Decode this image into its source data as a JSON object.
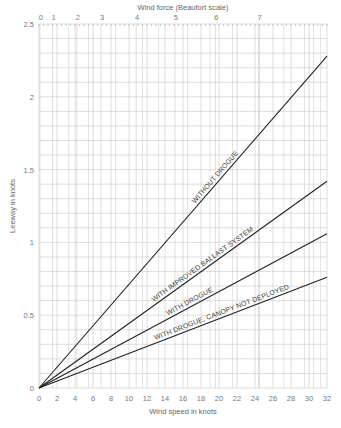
{
  "chart_data": {
    "type": "line",
    "title": "",
    "xlabel": "Wind speed in knots",
    "ylabel": "Leeway in knots",
    "x2label": "Wind force (Beaufort scale)",
    "xlim": [
      0,
      32
    ],
    "ylim": [
      0,
      2.5
    ],
    "grid": true,
    "legend_position": "inline labels along lines",
    "x_ticks": [
      0,
      2,
      4,
      6,
      8,
      10,
      12,
      14,
      16,
      18,
      20,
      22,
      24,
      26,
      28,
      30,
      32
    ],
    "y_ticks": [
      0,
      0.5,
      1,
      1.5,
      2,
      2.5
    ],
    "y_tick_labels": [
      "0",
      "0.5",
      "1",
      "1.5",
      "2",
      "2.5"
    ],
    "beaufort_ticks": [
      {
        "label": "0",
        "knots": 0.1
      },
      {
        "label": "1",
        "knots": 1.5
      },
      {
        "label": "2",
        "knots": 4.2
      },
      {
        "label": "3",
        "knots": 6.9
      },
      {
        "label": "4",
        "knots": 10.8
      },
      {
        "label": "5",
        "knots": 15.1
      },
      {
        "label": "6",
        "knots": 19.6
      },
      {
        "label": "7",
        "knots": 24.4
      }
    ],
    "series": [
      {
        "name": "WITHOUT DROGUE",
        "x": [
          0,
          32
        ],
        "values": [
          0,
          2.28
        ]
      },
      {
        "name": "WITH IMPROVED BALLAST SYSTEM",
        "x": [
          0,
          32
        ],
        "values": [
          0,
          1.42
        ]
      },
      {
        "name": "WITH DROGUE",
        "x": [
          0,
          32
        ],
        "values": [
          0,
          1.06
        ]
      },
      {
        "name": "WITH DROGUE, CANOPY NOT DEPLOYED",
        "x": [
          0,
          32
        ],
        "values": [
          0,
          0.76
        ]
      }
    ]
  },
  "labels": {
    "top_axis": "Wind force (Beaufort scale)",
    "bottom_axis": "Wind speed in knots",
    "left_axis": "Leeway in knots",
    "line1": "WITHOUT DROGUE",
    "line2": "WITH IMPROVED BALLAST SYSTEM",
    "line3": "WITH DROGUE",
    "line4": "WITH DROGUE, CANOPY NOT DEPLOYED"
  },
  "colors": {
    "grid": "#c8c8c8",
    "line": "#222222",
    "text": "#666666"
  }
}
